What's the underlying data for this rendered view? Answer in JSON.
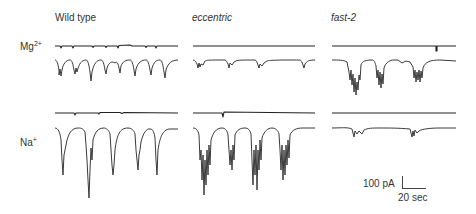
{
  "figure": {
    "columns": [
      {
        "label": "Wild type",
        "italic": false
      },
      {
        "label": "eccentric",
        "italic": true
      },
      {
        "label": "fast-2",
        "italic": true
      }
    ],
    "rows": [
      {
        "ion": "Mg",
        "charge": "2+"
      },
      {
        "ion": "Na",
        "charge": "+"
      }
    ],
    "scale_bar": {
      "current_label": "100 pA",
      "time_label": "20 sec"
    },
    "colors": {
      "trace": "#3a3a3a",
      "reference_trace": "#111111"
    }
  }
}
